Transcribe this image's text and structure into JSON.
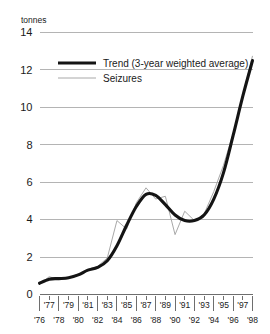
{
  "chart_data": {
    "type": "line",
    "title": "",
    "xlabel": "",
    "ylabel": "tonnes",
    "unit_label": "tonnes",
    "ylim": [
      0,
      14
    ],
    "yticks": [
      0,
      2,
      4,
      6,
      8,
      10,
      12,
      14
    ],
    "ytick_labels": [
      "0",
      "2",
      "4",
      "6",
      "8",
      "10",
      "12",
      "14"
    ],
    "grid": "horizontal",
    "legend_position": "upper-left",
    "x": [
      1976,
      1977,
      1978,
      1979,
      1980,
      1981,
      1982,
      1983,
      1984,
      1985,
      1986,
      1987,
      1988,
      1989,
      1990,
      1991,
      1992,
      1993,
      1994,
      1995,
      1996,
      1997,
      1998
    ],
    "xtick_labels_lower": [
      "'76",
      "'78",
      "'80",
      "'82",
      "'84",
      "'86",
      "'88",
      "'90",
      "'92",
      "'94",
      "'96",
      "'98"
    ],
    "xtick_labels_upper": [
      "'77",
      "'79",
      "'81",
      "'83",
      "'85",
      "'87",
      "'89",
      "'91",
      "'93",
      "'95",
      "'97"
    ],
    "series": [
      {
        "name": "Seizures",
        "style": "thin-gray",
        "color": "#a8a8a8",
        "values": [
          0.55,
          0.95,
          0.8,
          0.85,
          1.1,
          1.35,
          1.5,
          1.95,
          3.95,
          3.5,
          4.9,
          5.7,
          5.1,
          5.25,
          3.2,
          4.45,
          3.95,
          4.3,
          5.5,
          6.9,
          8.6,
          10.6,
          12.75
        ]
      },
      {
        "name": "Trend (3-year weighted average)",
        "style": "thick-black",
        "color": "#141414",
        "values": [
          0.6,
          0.82,
          0.85,
          0.9,
          1.05,
          1.3,
          1.45,
          1.8,
          2.6,
          3.7,
          4.7,
          5.35,
          5.3,
          4.8,
          4.25,
          3.95,
          3.95,
          4.25,
          5.1,
          6.5,
          8.5,
          10.6,
          12.5
        ]
      }
    ],
    "legend_entries": [
      {
        "label": "Trend (3-year weighted average)",
        "style": "thick-black"
      },
      {
        "label": "Seizures",
        "style": "thin-gray"
      }
    ]
  },
  "colors": {
    "trend": "#141414",
    "seizures": "#a8a8a8",
    "grid": "#b4b4b4",
    "axis": "#6e6e6e",
    "text": "#1a1a1a",
    "background": "#ffffff"
  }
}
